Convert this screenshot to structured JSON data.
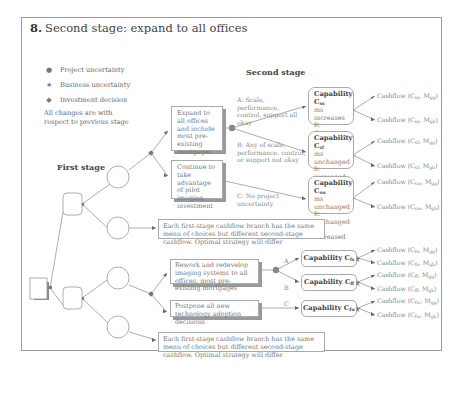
{
  "title": {
    "number": "8.",
    "text": "Second stage: expand to all offices"
  },
  "legend": [
    {
      "icon": "project-uncertainty-circle",
      "glyph": "●",
      "label": "Project uncertainty"
    },
    {
      "icon": "business-uncertainty-star",
      "glyph": "★",
      "label": "Business uncertainty"
    },
    {
      "icon": "investment-decision-diamond",
      "glyph": "◆",
      "label": "Investment decision"
    }
  ],
  "note": "All changes are with respect to previous stage",
  "stages": {
    "first": "First stage",
    "second": "Second stage"
  },
  "upper_tree": {
    "options": [
      "Expand to all offices and include most pre-existing mortgages",
      "Continue to take advantage of pilot imaging investment"
    ],
    "branches": [
      {
        "label": "A: Scale, performance, control, support all okay",
        "capability": "Capability C",
        "capability_sub": "ss",
        "details": [
          "ms increases",
          "fc decreases",
          "vc decreases"
        ],
        "cashflows": [
          {
            "text": "Cashflow (C",
            "sub": "ss",
            "mid": ", M",
            "sub2": "gg",
            "end": ")"
          },
          {
            "text": "Cashflow (C",
            "sub": "ss",
            "mid": ", M",
            "sub2": "gb",
            "end": ")"
          }
        ]
      },
      {
        "label": "B: Any of scale, performance, control, or support not okay",
        "capability": "Capability C",
        "capability_sub": "sf",
        "details": [
          "ms unchanged",
          "fc increased",
          "vc increased"
        ],
        "cashflows": [
          {
            "text": "Cashflow (C",
            "sub": "sf",
            "mid": ", M",
            "sub2": "gg",
            "end": ")"
          },
          {
            "text": "Cashflow (C",
            "sub": "sf",
            "mid": ", M",
            "sub2": "gb",
            "end": ")"
          }
        ]
      },
      {
        "label": "C: No project uncertainty",
        "capability": "Capability C",
        "capability_sub": "sw",
        "details": [
          "ms unchanged",
          "fc unchanged",
          "vc increased"
        ],
        "cashflows": [
          {
            "text": "Cashflow (C",
            "sub": "sw",
            "mid": ", M",
            "sub2": "gg",
            "end": ")"
          },
          {
            "text": "Cashflow (C",
            "sub": "sw",
            "mid": ", M",
            "sub2": "gb",
            "end": ")"
          }
        ]
      }
    ],
    "menu_note": "Each first-stage cashflow branch has the same menu of choices but different second-stage cashflow. Optimal strategy will differ"
  },
  "lower_tree": {
    "options": [
      "Rework and redevelop imaging systems to all offices, most pre-existing mortgages",
      "Postpone all new technology adoption decisions"
    ],
    "branches": [
      {
        "label": "A",
        "capability": "Capability C",
        "capability_sub": "fs",
        "cashflows": [
          {
            "text": "Cashflow (C",
            "sub": "fs",
            "mid": ", M",
            "sub2": "gg",
            "end": ")"
          },
          {
            "text": "Cashflow (C",
            "sub": "fs",
            "mid": ", M",
            "sub2": "gb",
            "end": ")"
          }
        ]
      },
      {
        "label": "B",
        "capability": "Capability C",
        "capability_sub": "ff",
        "cashflows": [
          {
            "text": "Cashflow (C",
            "sub": "ff",
            "mid": ", M",
            "sub2": "gg",
            "end": ")"
          },
          {
            "text": "Cashflow (C",
            "sub": "ff",
            "mid": ", M",
            "sub2": "gb",
            "end": ")"
          }
        ]
      },
      {
        "label": "C",
        "capability": "Capability C",
        "capability_sub": "fw",
        "cashflows": [
          {
            "text": "Cashflow (C",
            "sub": "fw",
            "mid": ", M",
            "sub2": "gg",
            "end": ")"
          },
          {
            "text": "Cashflow (C",
            "sub": "fw",
            "mid": ", M",
            "sub2": "gb",
            "end": ")"
          }
        ]
      }
    ],
    "menu_note": "Each first-stage cashflow branch has the same menu of choices but different second-stage cashflow. Optimal strategy will differ"
  },
  "colors": {
    "frame": "#9a9a9a",
    "line": "#8a8a8a",
    "text": "#777777",
    "node": "#888888"
  }
}
